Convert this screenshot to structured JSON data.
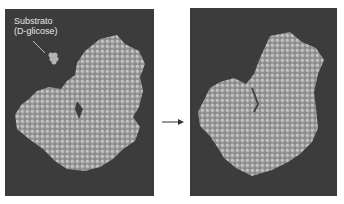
{
  "figure": {
    "left_panel": {
      "label_line1": "Substrato",
      "label_line2": "(D-glicose)",
      "background": "#3c3c3c",
      "molecule_color": "#9a9a9a"
    },
    "right_panel": {
      "background": "#3c3c3c",
      "molecule_color": "#9a9a9a"
    },
    "arrow": "right-arrow"
  }
}
